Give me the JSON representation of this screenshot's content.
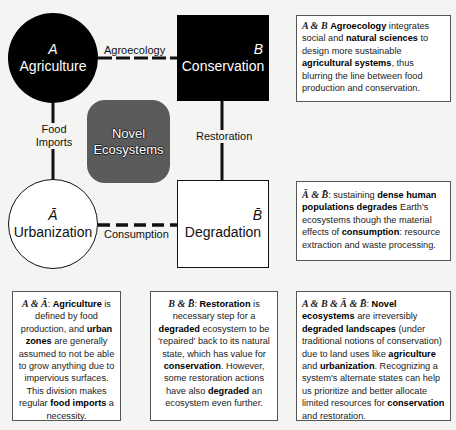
{
  "nodes": {
    "A": {
      "symbol": "A",
      "label": "Agriculture"
    },
    "B": {
      "symbol": "B",
      "label": "Conservation"
    },
    "A_bar": {
      "symbol": "Ā",
      "label": "Urbanization"
    },
    "B_bar": {
      "symbol": "B̄",
      "label": "Degradation"
    },
    "novel": {
      "line1": "Novel",
      "line2": "Ecosystems"
    }
  },
  "edges": {
    "A_B": "Agroecology",
    "A_Abar": {
      "line1": "Food",
      "line2": "Imports"
    },
    "B_Bbar": "Restoration",
    "Abar_Bbar": "Consumption"
  },
  "boxes": {
    "agroecology": {
      "heading": "A & B",
      "term1": "Agroecology",
      "t1": " integrates social and ",
      "term2": "natural sciences",
      "t2": " to design more sustainable ",
      "term3": "agricultural systems",
      "t3": ", thus blurring the line between food production and conservation."
    },
    "consumption": {
      "heading": "Ā & B̄",
      "t0": ": sustaining ",
      "term1": "dense human populations degrades",
      "t1": " Earth's ecosystems though the material effects of ",
      "term2": "consumption",
      "t2": ": resource extraction and waste processing."
    },
    "food_imports": {
      "heading": "A & Ā",
      "t0": ": ",
      "term1": "Agriculture",
      "t1": " is defined by food production, and ",
      "term2": "urban zones",
      "t2": " are generally assumed to not be able to grow anything due to impervious surfaces. This division makes regular ",
      "term3": "food imports",
      "t3": " a necessity."
    },
    "restoration": {
      "heading": "B & B̄",
      "t0": ": ",
      "term1": "Restoration",
      "t1": " is necessary step for a ",
      "term2": "degraded",
      "t2": " ecosystem to be 'repaired' back to its natural state, which has value for ",
      "term3": "conservation",
      "t3": ". However, some restoration actions have also ",
      "term4": "degraded",
      "t4": " an ecosystem even further."
    },
    "novel": {
      "heading": "A & B & Ā & B̄",
      "t0": ": ",
      "term1": "Novel ecosystems",
      "t1": " are irreversibly ",
      "term2": "degraded landscapes",
      "t2": " (under traditional notions of conservation) due to land uses like ",
      "term3": "agriculture",
      "t3": " and ",
      "term4": "urbanization",
      "t4": ". Recognizing a system's alternate states can help us prioritize and better allocate limited resources for ",
      "term5": "conservation",
      "t5": " and restoration."
    }
  },
  "colors": {
    "dark_node": "#000000",
    "novel_node": "#5b5b5b",
    "background": "#f4f4f2"
  }
}
